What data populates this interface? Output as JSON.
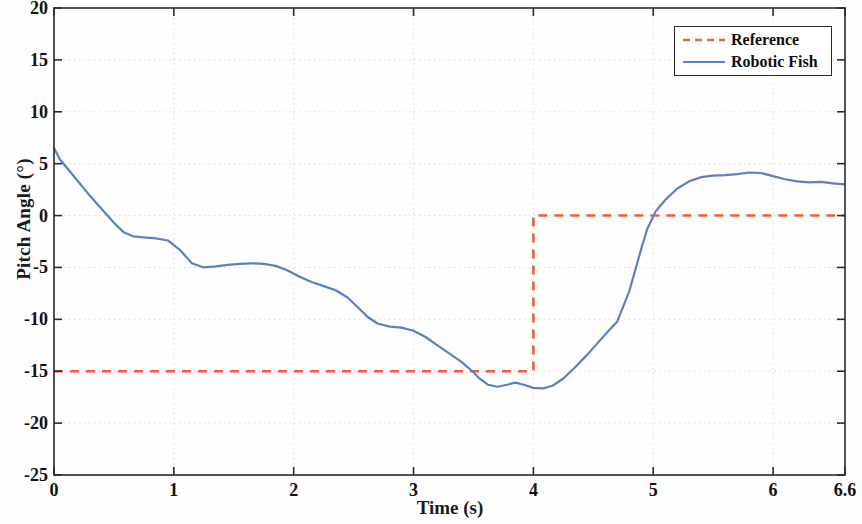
{
  "chart_data": {
    "type": "line",
    "title": "",
    "xlabel": "Time (s)",
    "ylabel": "Pitch Angle (°)",
    "xlim": [
      0,
      6.6
    ],
    "ylim": [
      -25,
      20
    ],
    "xticks": [
      0,
      1,
      2,
      3,
      4,
      5,
      6,
      6.6
    ],
    "xtick_labels": [
      "0",
      "1",
      "2",
      "3",
      "4",
      "5",
      "6",
      "6.6"
    ],
    "yticks": [
      20,
      15,
      10,
      5,
      0,
      -5,
      -10,
      -15,
      -20,
      -25
    ],
    "ytick_labels": [
      "20",
      "15",
      "10",
      "5",
      "0",
      "-5",
      "-10",
      "-15",
      "-20",
      "-25"
    ],
    "grid": true,
    "legend_position": "upper right",
    "series": [
      {
        "name": "Reference",
        "color": "#ED5C3C",
        "style": "dashed",
        "width": 2.6,
        "x": [
          0,
          4,
          4,
          6.6
        ],
        "y": [
          -15,
          -15,
          0,
          0
        ]
      },
      {
        "name": "Robotic Fish",
        "color": "#5B7FC7",
        "style": "solid",
        "width": 2.2,
        "x": [
          0,
          0.05,
          0.1,
          0.2,
          0.3,
          0.4,
          0.5,
          0.58,
          0.66,
          0.75,
          0.85,
          0.95,
          1.05,
          1.15,
          1.25,
          1.35,
          1.45,
          1.55,
          1.65,
          1.75,
          1.85,
          1.95,
          2.05,
          2.15,
          2.25,
          2.35,
          2.45,
          2.55,
          2.62,
          2.7,
          2.8,
          2.9,
          3.0,
          3.1,
          3.2,
          3.3,
          3.4,
          3.5,
          3.55,
          3.62,
          3.7,
          3.78,
          3.85,
          3.92,
          4.0,
          4.08,
          4.16,
          4.25,
          4.35,
          4.45,
          4.55,
          4.62,
          4.7,
          4.8,
          4.9,
          4.95,
          5.02,
          5.1,
          5.2,
          5.3,
          5.4,
          5.5,
          5.6,
          5.7,
          5.8,
          5.9,
          6.0,
          6.1,
          6.2,
          6.3,
          6.4,
          6.5,
          6.6
        ],
        "y": [
          6.5,
          5.4,
          4.7,
          3.3,
          1.9,
          0.6,
          -0.7,
          -1.6,
          -2.0,
          -2.1,
          -2.2,
          -2.4,
          -3.3,
          -4.6,
          -5.0,
          -4.9,
          -4.75,
          -4.65,
          -4.6,
          -4.65,
          -4.85,
          -5.3,
          -5.9,
          -6.4,
          -6.8,
          -7.2,
          -7.9,
          -9.0,
          -9.8,
          -10.4,
          -10.7,
          -10.8,
          -11.1,
          -11.7,
          -12.5,
          -13.3,
          -14.1,
          -15.1,
          -15.7,
          -16.3,
          -16.5,
          -16.3,
          -16.1,
          -16.3,
          -16.6,
          -16.65,
          -16.4,
          -15.7,
          -14.6,
          -13.4,
          -12.1,
          -11.2,
          -10.2,
          -7.3,
          -3.2,
          -1.3,
          0.4,
          1.5,
          2.6,
          3.3,
          3.7,
          3.85,
          3.9,
          4.0,
          4.15,
          4.1,
          3.8,
          3.5,
          3.3,
          3.2,
          3.25,
          3.1,
          3.0
        ]
      }
    ]
  },
  "legend": {
    "items": [
      {
        "label": "Reference",
        "color": "#ED5C3C",
        "style": "dashed"
      },
      {
        "label": "Robotic Fish",
        "color": "#5B7FC7",
        "style": "solid"
      }
    ]
  },
  "axes": {
    "x_axis_label": "Time (s)",
    "y_axis_label": "Pitch Angle (°)"
  },
  "colors": {
    "reference": "#ED5C3C",
    "robotic_fish": "#5B7FC7",
    "axis": "#2b2b2b",
    "grid": "#d8d8d8",
    "background": "#ffffff"
  }
}
